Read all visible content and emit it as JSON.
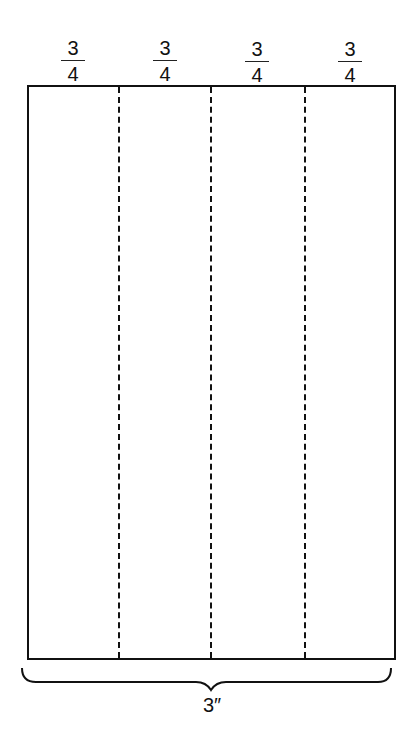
{
  "diagram": {
    "segments": [
      {
        "numerator": "3",
        "denominator": "4"
      },
      {
        "numerator": "3",
        "denominator": "4"
      },
      {
        "numerator": "3",
        "denominator": "4"
      },
      {
        "numerator": "3",
        "denominator": "4"
      }
    ],
    "total_label": "3″",
    "divider_style": "dashed",
    "segment_count": 4
  }
}
